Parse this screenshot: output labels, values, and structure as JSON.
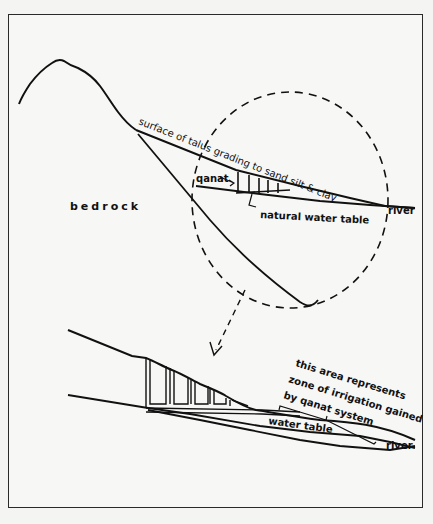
{
  "figure": {
    "upper_section": {
      "labels": {
        "surface": "surface of talus grading to sand silt & clay",
        "bedrock": "bedrock",
        "qanat": "qanat",
        "natural_water_table": "natural water table",
        "river": "river"
      }
    },
    "lower_section": {
      "labels": {
        "annotation_line1": "this area represents",
        "annotation_line2": "zone of irrigation gained",
        "annotation_line3": "by qanat system",
        "water_table": "water table",
        "river": "river"
      }
    },
    "colors": {
      "line": "#111111",
      "background": "#f7f7f5",
      "frame": "#2a2a2a"
    }
  }
}
